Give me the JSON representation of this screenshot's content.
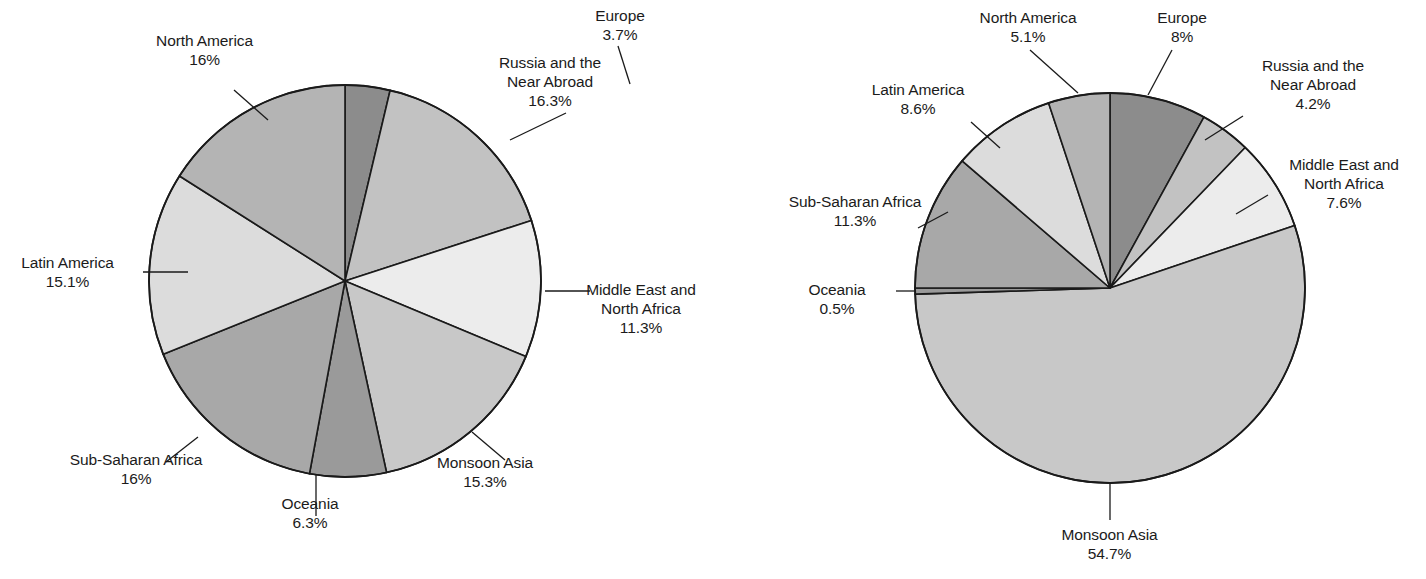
{
  "chart_data": [
    {
      "type": "pie",
      "title": "",
      "chart_id": "left-pie",
      "center": [
        345,
        281
      ],
      "radius": 196,
      "start_angle_deg": -90,
      "direction": "clockwise",
      "categories": [
        "Europe",
        "Russia and the Near Abroad",
        "Middle East and North Africa",
        "Monsoon Asia",
        "Oceania",
        "Sub-Saharan Africa",
        "Latin America",
        "North America"
      ],
      "values": [
        3.7,
        16.3,
        11.3,
        15.3,
        6.3,
        16.0,
        15.1,
        16.0
      ],
      "labels": [
        {
          "name": "Europe",
          "value": "3.7%",
          "lines": [
            "Europe",
            "3.7%"
          ],
          "align": "center",
          "x": 560,
          "y": 6,
          "w": 120,
          "leader": [
            [
              618,
              46
            ],
            [
              630,
              84
            ]
          ]
        },
        {
          "name": "Russia and the Near Abroad",
          "value": "16.3%",
          "lines": [
            "Russia and the",
            "Near Abroad",
            "16.3%"
          ],
          "align": "center",
          "x": 460,
          "y": 53,
          "w": 180,
          "leader": [
            [
              566,
              113
            ],
            [
              510,
              140
            ]
          ]
        },
        {
          "name": "Middle East and North Africa",
          "value": "11.3%",
          "lines": [
            "Middle East and",
            "North Africa",
            "11.3%"
          ],
          "align": "center",
          "x": 556,
          "y": 280,
          "w": 170,
          "leader": [
            [
              545,
              291
            ],
            [
              590,
              291
            ]
          ]
        },
        {
          "name": "Monsoon Asia",
          "value": "15.3%",
          "lines": [
            "Monsoon Asia",
            "15.3%"
          ],
          "align": "center",
          "x": 400,
          "y": 453,
          "w": 170,
          "leader": [
            [
              472,
              432
            ],
            [
              505,
              460
            ]
          ]
        },
        {
          "name": "Oceania",
          "value": "6.3%",
          "lines": [
            "Oceania",
            "6.3%"
          ],
          "align": "center",
          "x": 255,
          "y": 494,
          "w": 110,
          "leader": [
            [
              316,
              474
            ],
            [
              316,
              516
            ]
          ]
        },
        {
          "name": "Sub-Saharan Africa",
          "value": "16%",
          "lines": [
            "Sub-Saharan Africa",
            "16%"
          ],
          "align": "center",
          "x": 36,
          "y": 450,
          "w": 200,
          "leader": [
            [
              198,
              437
            ],
            [
              166,
              462
            ]
          ]
        },
        {
          "name": "Latin America",
          "value": "15.1%",
          "lines": [
            "Latin America",
            "15.1%"
          ],
          "align": "center",
          "x": 0,
          "y": 253,
          "w": 135,
          "leader": [
            [
              143,
              272
            ],
            [
              188,
              272
            ]
          ]
        },
        {
          "name": "North America",
          "value": "16%",
          "lines": [
            "North America",
            "16%"
          ],
          "align": "center",
          "x": 127,
          "y": 31,
          "w": 155,
          "leader": [
            [
              234,
              90
            ],
            [
              268,
              120
            ]
          ]
        }
      ]
    },
    {
      "type": "pie",
      "title": "",
      "chart_id": "right-pie",
      "center": [
        1110,
        288
      ],
      "radius": 195,
      "start_angle_deg": -90,
      "direction": "clockwise",
      "categories": [
        "Europe",
        "Russia and the Near Abroad",
        "Middle East and North Africa",
        "Monsoon Asia",
        "Oceania",
        "Sub-Saharan Africa",
        "Latin America",
        "North America"
      ],
      "values": [
        8.0,
        4.2,
        7.6,
        54.7,
        0.5,
        11.3,
        8.6,
        5.1
      ],
      "labels": [
        {
          "name": "North America",
          "value": "5.1%",
          "lines": [
            "North America",
            "5.1%"
          ],
          "align": "center",
          "x": 948,
          "y": 8,
          "w": 160,
          "leader": [
            [
              1030,
              50
            ],
            [
              1078,
              93
            ]
          ]
        },
        {
          "name": "Europe",
          "value": "8%",
          "lines": [
            "Europe",
            "8%"
          ],
          "align": "center",
          "x": 1132,
          "y": 8,
          "w": 100,
          "leader": [
            [
              1172,
              50
            ],
            [
              1148,
              95
            ]
          ]
        },
        {
          "name": "Russia and the Near Abroad",
          "value": "4.2%",
          "lines": [
            "Russia and the",
            "Near Abroad",
            "4.2%"
          ],
          "align": "center",
          "x": 1233,
          "y": 56,
          "w": 160,
          "leader": [
            [
              1243,
              116
            ],
            [
              1205,
              140
            ]
          ]
        },
        {
          "name": "Middle East and North Africa",
          "value": "7.6%",
          "lines": [
            "Middle East and",
            "North Africa",
            "7.6%"
          ],
          "align": "center",
          "x": 1263,
          "y": 155,
          "w": 162,
          "leader": [
            [
              1268,
              195
            ],
            [
              1236,
              214
            ]
          ]
        },
        {
          "name": "Monsoon Asia",
          "value": "54.7%",
          "lines": [
            "Monsoon Asia",
            "54.7%"
          ],
          "align": "center",
          "x": 1032,
          "y": 525,
          "w": 155,
          "leader": [
            [
              1110,
              482
            ],
            [
              1110,
              520
            ]
          ]
        },
        {
          "name": "Oceania",
          "value": "0.5%",
          "lines": [
            "Oceania",
            "0.5%"
          ],
          "align": "center",
          "x": 782,
          "y": 280,
          "w": 110,
          "leader": [
            [
              896,
              291
            ],
            [
              916,
              291
            ]
          ]
        },
        {
          "name": "Sub-Saharan Africa",
          "value": "11.3%",
          "lines": [
            "Sub-Saharan Africa",
            "11.3%"
          ],
          "align": "center",
          "x": 766,
          "y": 192,
          "w": 178,
          "leader": [
            [
              948,
              212
            ],
            [
              918,
              228
            ]
          ]
        },
        {
          "name": "Latin America",
          "value": "8.6%",
          "lines": [
            "Latin America",
            "8.6%"
          ],
          "align": "center",
          "x": 838,
          "y": 80,
          "w": 160,
          "leader": [
            [
              971,
              122
            ],
            [
              1000,
              148
            ]
          ]
        }
      ]
    }
  ],
  "palette": {
    "slice_fills": {
      "Europe": "#8c8c8c",
      "Russia and the Near Abroad": "#c2c2c2",
      "Middle East and North Africa": "#ececec",
      "Monsoon Asia": "#c8c8c8",
      "Oceania": "#9a9a9a",
      "Sub-Saharan Africa": "#a8a8a8",
      "Latin America": "#dcdcdc",
      "North America": "#b4b4b4"
    },
    "stroke": "#1a1a1a",
    "label_text": "#1b1b1b",
    "background": "#ffffff"
  }
}
